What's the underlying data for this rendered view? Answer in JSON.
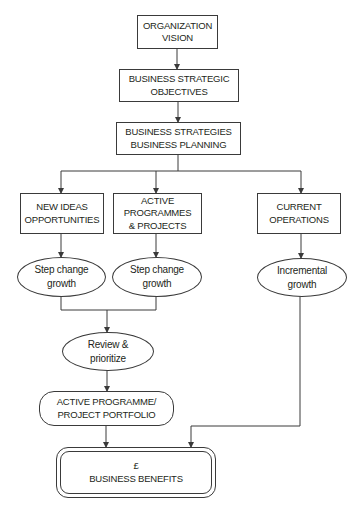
{
  "diagram": {
    "nodes": {
      "vision": {
        "lines": [
          "ORGANIZATION",
          "VISION"
        ],
        "shape": "rectangle"
      },
      "objectives": {
        "lines": [
          "BUSINESS STRATEGIC",
          "OBJECTIVES"
        ],
        "shape": "rectangle"
      },
      "strategies": {
        "lines": [
          "BUSINESS STRATEGIES",
          "BUSINESS PLANNING"
        ],
        "shape": "rectangle"
      },
      "new_ideas": {
        "lines": [
          "NEW IDEAS",
          "OPPORTUNITIES"
        ],
        "shape": "rectangle"
      },
      "active_programmes": {
        "lines": [
          "ACTIVE",
          "PROGRAMMES",
          "& PROJECTS"
        ],
        "shape": "rectangle"
      },
      "current_operations": {
        "lines": [
          "CURRENT",
          "OPERATIONS"
        ],
        "shape": "rectangle"
      },
      "step_change_1": {
        "lines": [
          "Step change",
          "growth"
        ],
        "shape": "ellipse"
      },
      "step_change_2": {
        "lines": [
          "Step change",
          "growth"
        ],
        "shape": "ellipse"
      },
      "incremental": {
        "lines": [
          "Incremental",
          "growth"
        ],
        "shape": "ellipse"
      },
      "review": {
        "lines": [
          "Review &",
          "prioritize"
        ],
        "shape": "ellipse"
      },
      "portfolio": {
        "lines": [
          "ACTIVE PROGRAMME/",
          "PROJECT PORTFOLIO"
        ],
        "shape": "rounded-rectangle"
      },
      "benefits": {
        "lines": [
          "£",
          "BUSINESS BENEFITS"
        ],
        "shape": "double-rounded-rectangle"
      }
    },
    "edges": [
      {
        "from": "vision",
        "to": "objectives"
      },
      {
        "from": "objectives",
        "to": "strategies"
      },
      {
        "from": "strategies",
        "to": "new_ideas"
      },
      {
        "from": "strategies",
        "to": "active_programmes"
      },
      {
        "from": "strategies",
        "to": "current_operations"
      },
      {
        "from": "new_ideas",
        "to": "step_change_1"
      },
      {
        "from": "active_programmes",
        "to": "step_change_2"
      },
      {
        "from": "current_operations",
        "to": "incremental"
      },
      {
        "from": "step_change_1",
        "to": "review"
      },
      {
        "from": "step_change_2",
        "to": "review"
      },
      {
        "from": "review",
        "to": "portfolio"
      },
      {
        "from": "portfolio",
        "to": "benefits"
      },
      {
        "from": "incremental",
        "to": "benefits"
      }
    ],
    "colors": {
      "stroke": "#3a3a3a",
      "text": "#231f20",
      "background": "#ffffff"
    }
  }
}
